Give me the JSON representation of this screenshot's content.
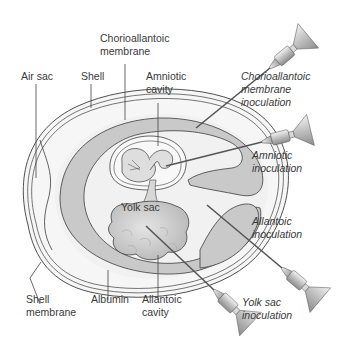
{
  "diagram": {
    "colors": {
      "background": "#ffffff",
      "shell_fill": "#f4f4f4",
      "albumin_fill": "#f0f0f0",
      "allantoic_fill": "#c9c9c9",
      "amniotic_fill": "#f7f7f7",
      "yolk_fill": "#d4d4d4",
      "outline": "#3c3c3c",
      "text": "#3a3a3a"
    },
    "structure_labels": {
      "chorioallantoic_line1": "Chorioallantoic",
      "chorioallantoic_line2": "membrane",
      "air_sac": "Air sac",
      "shell": "Shell",
      "amniotic_line1": "Amniotic",
      "amniotic_line2": "cavity",
      "yolk_sac": "Yolk sac",
      "shell_membrane_line1": "Shell",
      "shell_membrane_line2": "membrane",
      "albumin": "Albumin",
      "allantoic_cavity_line1": "Allantoic",
      "allantoic_cavity_line2": "cavity"
    },
    "inoculation_labels": {
      "cam_line1": "Chorioallantoic",
      "cam_line2": "membrane",
      "cam_line3": "inoculation",
      "amniotic_line1": "Amniotic",
      "amniotic_line2": "inoculation",
      "allantoic_line1": "Allantoic",
      "allantoic_line2": "inoculation",
      "yolk_line1": "Yolk sac",
      "yolk_line2": "inoculation"
    }
  }
}
